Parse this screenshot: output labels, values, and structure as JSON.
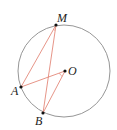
{
  "diagram": {
    "type": "circle-geometry",
    "circle": {
      "center": "O",
      "stroke": "#8a8a8a"
    },
    "points": [
      {
        "name": "M",
        "label": "M"
      },
      {
        "name": "A",
        "label": "A"
      },
      {
        "name": "B",
        "label": "B"
      },
      {
        "name": "O",
        "label": "O"
      }
    ],
    "segments": [
      {
        "from": "M",
        "to": "A",
        "color": "#e07a6a"
      },
      {
        "from": "M",
        "to": "B",
        "color": "#e07a6a"
      },
      {
        "from": "A",
        "to": "O",
        "color": "#e07a6a"
      },
      {
        "from": "B",
        "to": "O",
        "color": "#e07a6a"
      }
    ],
    "angle_marks": [
      {
        "vertex": "M",
        "between": [
          "A",
          "B"
        ]
      },
      {
        "vertex": "O",
        "between": [
          "A",
          "B"
        ]
      }
    ],
    "labels": {
      "M": "M",
      "A": "A",
      "B": "B",
      "O": "O"
    }
  }
}
